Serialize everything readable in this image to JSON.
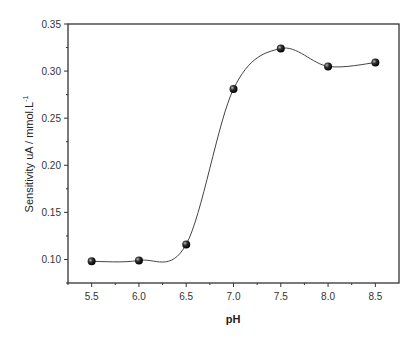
{
  "chart_data": {
    "type": "line",
    "title": "",
    "xlabel": "pH",
    "ylabel": "Sensitivity uA / mmol.L",
    "ylabel_superscript": "-1",
    "x": [
      5.5,
      6.0,
      6.5,
      7.0,
      7.5,
      8.0,
      8.5
    ],
    "series": [
      {
        "name": "Sensitivity",
        "values": [
          0.098,
          0.099,
          0.116,
          0.281,
          0.324,
          0.305,
          0.309
        ],
        "marker": "sphere",
        "line": "smooth spline",
        "color": "#000000"
      }
    ],
    "xlim": [
      5.25,
      8.75
    ],
    "ylim": [
      0.075,
      0.35
    ],
    "x_ticks": [
      "5.5",
      "6.0",
      "6.5",
      "7.0",
      "7.5",
      "8.0",
      "8.5"
    ],
    "y_ticks": [
      "0.10",
      "0.15",
      "0.20",
      "0.25",
      "0.30",
      "0.35"
    ],
    "grid": false,
    "legend": null
  }
}
